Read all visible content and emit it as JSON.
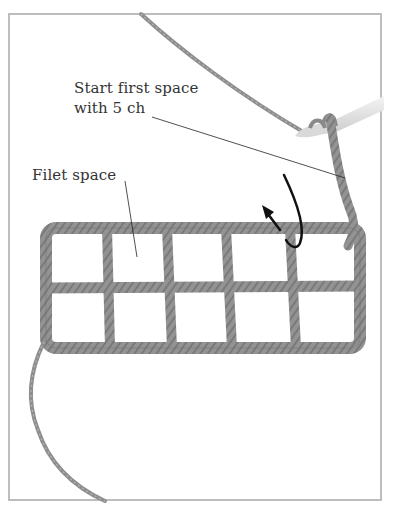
{
  "figure": {
    "labels": {
      "start_first_space_line1": "Start first space",
      "start_first_space_line2": "with 5 ch",
      "filet_space": "Filet space"
    },
    "grid": {
      "rows": 2,
      "columns": 5
    },
    "colors": {
      "yarn": "#8f8f8f",
      "yarn_dark": "#6e6e6e",
      "hook": "#e3e3e3",
      "frame": "#bdbdbd",
      "arrow": "#111111",
      "text": "#333333"
    },
    "icons": [
      "turn-arrow-icon",
      "crochet-hook-icon"
    ]
  }
}
